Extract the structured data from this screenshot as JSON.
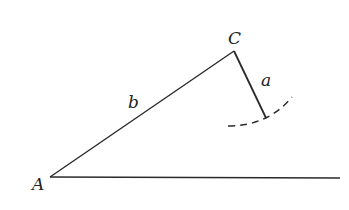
{
  "diagram": {
    "type": "triangle-construction",
    "vertices": {
      "A": {
        "label": "A",
        "x": 50,
        "y": 177
      },
      "C": {
        "label": "C",
        "x": 234,
        "y": 51
      }
    },
    "segments": {
      "b": {
        "label": "b",
        "from": "A",
        "to": "C"
      },
      "a": {
        "label": "a",
        "from": "C",
        "to": [
          266,
          118
        ]
      },
      "base": {
        "from": "A",
        "to": [
          340,
          178
        ]
      }
    },
    "arc": {
      "center": "C",
      "style": "dashed"
    },
    "colors": {
      "line": "#2a2a2a",
      "label": "#222222",
      "background": "#ffffff"
    }
  }
}
